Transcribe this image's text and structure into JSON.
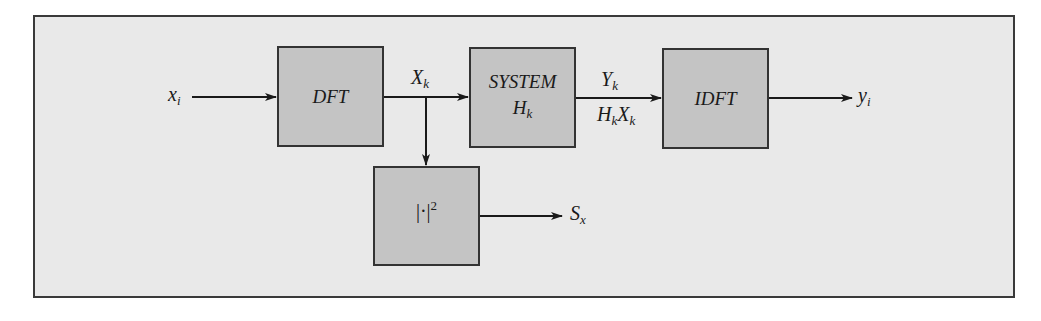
{
  "diagram": {
    "blocks": {
      "dft": {
        "label": "DFT"
      },
      "system": {
        "label": "SYSTEM",
        "sub_main": "H",
        "sub_index": "k"
      },
      "idft": {
        "label": "IDFT"
      },
      "magnitude_squared": {
        "main": "|·|",
        "power": "2"
      }
    },
    "signals": {
      "input": {
        "main": "x",
        "index": "i"
      },
      "dft_output": {
        "main": "X",
        "index": "k"
      },
      "system_output_top": {
        "main": "Y",
        "index": "k"
      },
      "system_output_bottom": {
        "main1": "H",
        "index1": "k",
        "main2": "X",
        "index2": "k"
      },
      "output": {
        "main": "y",
        "index": "i"
      },
      "spectrum": {
        "main": "S",
        "index": "x"
      }
    },
    "colors": {
      "background": "#e9e9e9",
      "block_fill": "#c4c4c4",
      "line": "#1a1a1a"
    }
  }
}
